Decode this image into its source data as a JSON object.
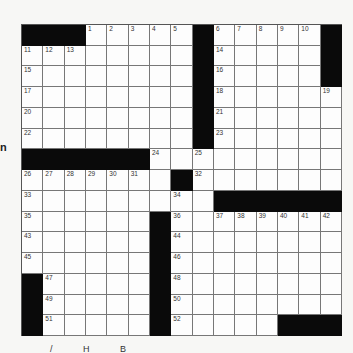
{
  "page": {
    "edge_fragment": "n",
    "footer_fragment": "/ H B"
  },
  "crossword": {
    "rows": 15,
    "cols": 15,
    "black_cells": [
      [
        0,
        0
      ],
      [
        0,
        1
      ],
      [
        0,
        2
      ],
      [
        0,
        8
      ],
      [
        0,
        14
      ],
      [
        1,
        8
      ],
      [
        1,
        14
      ],
      [
        2,
        8
      ],
      [
        2,
        14
      ],
      [
        3,
        8
      ],
      [
        4,
        8
      ],
      [
        5,
        8
      ],
      [
        6,
        0
      ],
      [
        6,
        1
      ],
      [
        6,
        2
      ],
      [
        6,
        3
      ],
      [
        6,
        4
      ],
      [
        6,
        5
      ],
      [
        7,
        7
      ],
      [
        8,
        9
      ],
      [
        8,
        10
      ],
      [
        8,
        11
      ],
      [
        8,
        12
      ],
      [
        8,
        13
      ],
      [
        8,
        14
      ],
      [
        9,
        6
      ],
      [
        10,
        6
      ],
      [
        11,
        6
      ],
      [
        12,
        0
      ],
      [
        12,
        6
      ],
      [
        13,
        0
      ],
      [
        13,
        6
      ],
      [
        14,
        0
      ],
      [
        14,
        6
      ],
      [
        14,
        12
      ],
      [
        14,
        13
      ],
      [
        14,
        14
      ]
    ],
    "numbers": [
      {
        "r": 0,
        "c": 3,
        "n": "1"
      },
      {
        "r": 0,
        "c": 4,
        "n": "2"
      },
      {
        "r": 0,
        "c": 5,
        "n": "3"
      },
      {
        "r": 0,
        "c": 6,
        "n": "4"
      },
      {
        "r": 0,
        "c": 7,
        "n": "5"
      },
      {
        "r": 0,
        "c": 9,
        "n": "6"
      },
      {
        "r": 0,
        "c": 10,
        "n": "7"
      },
      {
        "r": 0,
        "c": 11,
        "n": "8"
      },
      {
        "r": 0,
        "c": 12,
        "n": "9"
      },
      {
        "r": 0,
        "c": 13,
        "n": "10"
      },
      {
        "r": 1,
        "c": 0,
        "n": "11"
      },
      {
        "r": 1,
        "c": 1,
        "n": "12"
      },
      {
        "r": 1,
        "c": 2,
        "n": "13"
      },
      {
        "r": 1,
        "c": 9,
        "n": "14"
      },
      {
        "r": 2,
        "c": 0,
        "n": "15"
      },
      {
        "r": 2,
        "c": 9,
        "n": "16"
      },
      {
        "r": 3,
        "c": 0,
        "n": "17"
      },
      {
        "r": 3,
        "c": 9,
        "n": "18"
      },
      {
        "r": 3,
        "c": 14,
        "n": "19"
      },
      {
        "r": 4,
        "c": 0,
        "n": "20"
      },
      {
        "r": 4,
        "c": 9,
        "n": "21"
      },
      {
        "r": 5,
        "c": 0,
        "n": "22"
      },
      {
        "r": 5,
        "c": 9,
        "n": "23"
      },
      {
        "r": 6,
        "c": 6,
        "n": "24"
      },
      {
        "r": 6,
        "c": 8,
        "n": "25"
      },
      {
        "r": 7,
        "c": 0,
        "n": "26"
      },
      {
        "r": 7,
        "c": 1,
        "n": "27"
      },
      {
        "r": 7,
        "c": 2,
        "n": "28"
      },
      {
        "r": 7,
        "c": 3,
        "n": "29"
      },
      {
        "r": 7,
        "c": 4,
        "n": "30"
      },
      {
        "r": 7,
        "c": 5,
        "n": "31"
      },
      {
        "r": 7,
        "c": 8,
        "n": "32"
      },
      {
        "r": 8,
        "c": 0,
        "n": "33"
      },
      {
        "r": 8,
        "c": 7,
        "n": "34"
      },
      {
        "r": 9,
        "c": 0,
        "n": "35"
      },
      {
        "r": 9,
        "c": 7,
        "n": "36"
      },
      {
        "r": 9,
        "c": 9,
        "n": "37"
      },
      {
        "r": 9,
        "c": 10,
        "n": "38"
      },
      {
        "r": 9,
        "c": 11,
        "n": "39"
      },
      {
        "r": 9,
        "c": 12,
        "n": "40"
      },
      {
        "r": 9,
        "c": 13,
        "n": "41"
      },
      {
        "r": 9,
        "c": 14,
        "n": "42"
      },
      {
        "r": 10,
        "c": 0,
        "n": "43"
      },
      {
        "r": 10,
        "c": 7,
        "n": "44"
      },
      {
        "r": 11,
        "c": 0,
        "n": "45"
      },
      {
        "r": 11,
        "c": 7,
        "n": "46"
      },
      {
        "r": 12,
        "c": 1,
        "n": "47"
      },
      {
        "r": 12,
        "c": 7,
        "n": "48"
      },
      {
        "r": 13,
        "c": 1,
        "n": "49"
      },
      {
        "r": 13,
        "c": 7,
        "n": "50"
      },
      {
        "r": 14,
        "c": 1,
        "n": "51"
      },
      {
        "r": 14,
        "c": 7,
        "n": "52"
      }
    ],
    "colors": {
      "black": "#0a0a0a",
      "white": "#fdfdfd",
      "line": "#777777"
    }
  }
}
